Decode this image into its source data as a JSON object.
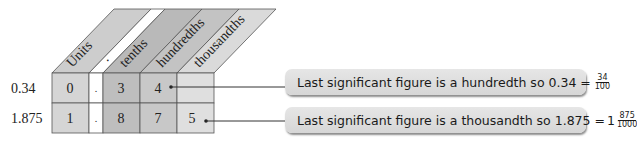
{
  "columns": [
    {
      "label": "Units",
      "header_fill": "#cdcdcd",
      "cell_fill": "#d5d5d5"
    },
    {
      "label": ".",
      "header_fill": "#ffffff",
      "cell_fill": "#ffffff"
    },
    {
      "label": "tenths",
      "header_fill": "#b9b9b9",
      "cell_fill": "#bebebe"
    },
    {
      "label": "hundredths",
      "header_fill": "#c3c3c3",
      "cell_fill": "#c8c8c8"
    },
    {
      "label": "thousandths",
      "header_fill": "#dadada",
      "cell_fill": "#dfdfdf"
    }
  ],
  "rows": [
    {
      "label": "0.34",
      "cells": [
        "0",
        ".",
        "3",
        "4",
        ""
      ]
    },
    {
      "label": "1.875",
      "cells": [
        "1",
        ".",
        "8",
        "7",
        "5"
      ]
    }
  ],
  "callouts": [
    {
      "text": "Last significant figure is a hundredth so 0.34 =",
      "whole": "",
      "numerator": "34",
      "denominator": "100"
    },
    {
      "text": "Last significant figure is a thousandth so 1.875 =",
      "whole": "1",
      "numerator": "875",
      "denominator": "1000"
    }
  ],
  "colors": {
    "line": "#333333",
    "text": "#222222"
  }
}
